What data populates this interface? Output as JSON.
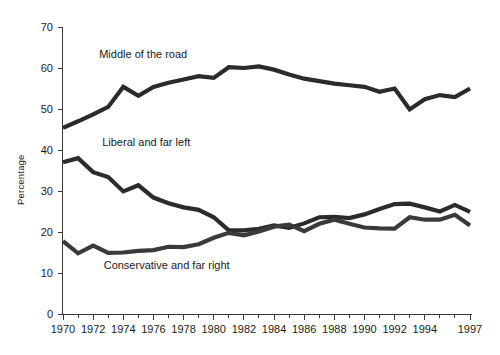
{
  "chart_data": {
    "type": "line",
    "title": "",
    "xlabel": "",
    "ylabel": "Percentage",
    "xlim": [
      1970,
      1997
    ],
    "ylim": [
      0,
      70
    ],
    "grid": false,
    "legend_position": "inline-labels",
    "x": [
      1970,
      1971,
      1972,
      1973,
      1974,
      1975,
      1976,
      1977,
      1978,
      1979,
      1980,
      1981,
      1982,
      1983,
      1984,
      1985,
      1986,
      1987,
      1988,
      1989,
      1990,
      1991,
      1992,
      1993,
      1994,
      1995,
      1996,
      1997
    ],
    "xtick_labels": [
      "1970",
      "1972",
      "1974",
      "1976",
      "1978",
      "1980",
      "1982",
      "1984",
      "1986",
      "1988",
      "1990",
      "1992",
      "1994",
      "1997"
    ],
    "xtick_values": [
      1970,
      1972,
      1974,
      1976,
      1978,
      1980,
      1982,
      1984,
      1986,
      1988,
      1990,
      1992,
      1994,
      1997
    ],
    "ytick_labels": [
      "0",
      "10",
      "20",
      "30",
      "40",
      "50",
      "60",
      "70"
    ],
    "ytick_values": [
      0,
      10,
      20,
      30,
      40,
      50,
      60,
      70
    ],
    "series": [
      {
        "name": "Middle of the road",
        "label": "Middle of the road",
        "color": "#2b2b2b",
        "label_x": 1972.4,
        "label_y": 62.5,
        "values": [
          45.4,
          47.0,
          48.7,
          50.5,
          55.4,
          53.2,
          55.4,
          56.4,
          57.2,
          58.0,
          57.6,
          60.2,
          60.0,
          60.4,
          59.6,
          58.4,
          57.4,
          56.8,
          56.2,
          55.8,
          55.4,
          54.2,
          55.0,
          49.9,
          52.4,
          53.4,
          52.9,
          55.0
        ]
      },
      {
        "name": "Liberal and far left",
        "label": "Liberal and far left",
        "color": "#2b2b2b",
        "label_x": 1972.6,
        "label_y": 41.0,
        "values": [
          37.0,
          38.0,
          34.6,
          33.4,
          29.9,
          31.4,
          28.4,
          27.0,
          26.0,
          25.4,
          23.6,
          20.4,
          20.4,
          20.8,
          21.6,
          21.0,
          22.1,
          23.6,
          23.7,
          23.4,
          24.3,
          25.6,
          26.8,
          26.9,
          26.0,
          25.0,
          26.6,
          24.9
        ]
      },
      {
        "name": "Conservative and far right",
        "label": "Conservative and far right",
        "color": "#3a3a3a",
        "label_x": 1972.7,
        "label_y": 11.0,
        "values": [
          17.8,
          14.8,
          16.7,
          14.9,
          15.0,
          15.4,
          15.6,
          16.4,
          16.3,
          17.0,
          18.6,
          19.8,
          19.2,
          20.1,
          21.3,
          21.8,
          20.2,
          22.0,
          23.0,
          22.0,
          21.1,
          20.9,
          20.8,
          23.6,
          23.0,
          23.0,
          24.2,
          21.6
        ]
      }
    ]
  },
  "plot": {
    "left_px": 63,
    "right_px": 470,
    "top_px": 27,
    "bottom_px": 314,
    "line_width": 4.2
  }
}
